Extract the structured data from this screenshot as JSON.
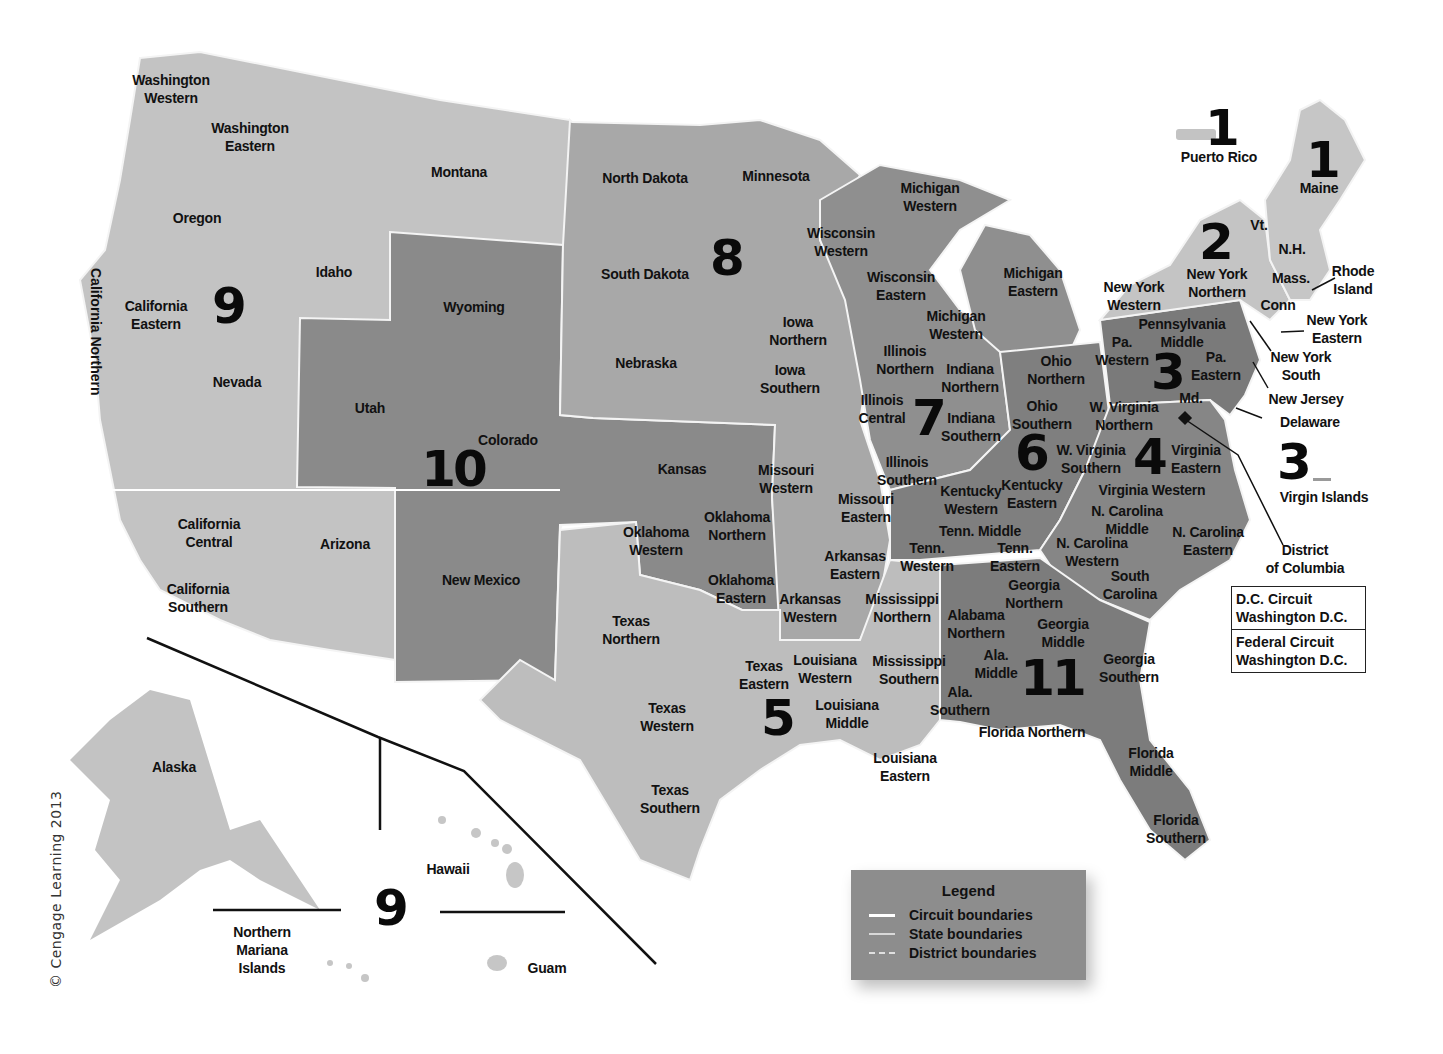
{
  "colors": {
    "background": "#ffffff",
    "circuit_light": "#c3c3c3",
    "circuit_mid": "#a8a8a8",
    "circuit_dark": "#8a8a8a",
    "circuit_darker": "#7a7a7a",
    "boundary": "#f4f4f4",
    "text": "#111111"
  },
  "circuits": [
    {
      "id": "1",
      "label": "1",
      "x": 1221,
      "y": 128
    },
    {
      "id": "1b",
      "label": "1",
      "x": 1322,
      "y": 160
    },
    {
      "id": "2",
      "label": "2",
      "x": 1215,
      "y": 242
    },
    {
      "id": "3",
      "label": "3",
      "x": 1167,
      "y": 372
    },
    {
      "id": "3b",
      "label": "3",
      "x": 1293,
      "y": 462
    },
    {
      "id": "4",
      "label": "4",
      "x": 1149,
      "y": 457
    },
    {
      "id": "5",
      "label": "5",
      "x": 777,
      "y": 718
    },
    {
      "id": "6",
      "label": "6",
      "x": 1031,
      "y": 453
    },
    {
      "id": "7",
      "label": "7",
      "x": 928,
      "y": 418
    },
    {
      "id": "8",
      "label": "8",
      "x": 726,
      "y": 258
    },
    {
      "id": "9",
      "label": "9",
      "x": 228,
      "y": 306
    },
    {
      "id": "9b",
      "label": "9",
      "x": 390,
      "y": 908
    },
    {
      "id": "10",
      "label": "10",
      "x": 453,
      "y": 469
    },
    {
      "id": "11",
      "label": "11",
      "x": 1052,
      "y": 678
    }
  ],
  "districts": [
    {
      "label": "Washington\nWestern",
      "x": 171,
      "y": 89
    },
    {
      "label": "Washington\nEastern",
      "x": 250,
      "y": 137
    },
    {
      "label": "Montana",
      "x": 459,
      "y": 172
    },
    {
      "label": "Oregon",
      "x": 197,
      "y": 218
    },
    {
      "label": "Idaho",
      "x": 334,
      "y": 272
    },
    {
      "label": "California\nEastern",
      "x": 156,
      "y": 315
    },
    {
      "label": "Nevada",
      "x": 237,
      "y": 382
    },
    {
      "label": "California\nCentral",
      "x": 209,
      "y": 533
    },
    {
      "label": "California\nSouthern",
      "x": 198,
      "y": 598
    },
    {
      "label": "Arizona",
      "x": 345,
      "y": 544
    },
    {
      "label": "Utah",
      "x": 370,
      "y": 408
    },
    {
      "label": "Wyoming",
      "x": 474,
      "y": 307
    },
    {
      "label": "Colorado",
      "x": 508,
      "y": 440
    },
    {
      "label": "New Mexico",
      "x": 481,
      "y": 580
    },
    {
      "label": "Kansas",
      "x": 682,
      "y": 469
    },
    {
      "label": "Oklahoma\nWestern",
      "x": 656,
      "y": 541
    },
    {
      "label": "Oklahoma\nNorthern",
      "x": 737,
      "y": 526
    },
    {
      "label": "Oklahoma\nEastern",
      "x": 741,
      "y": 589
    },
    {
      "label": "North Dakota",
      "x": 645,
      "y": 178
    },
    {
      "label": "South Dakota",
      "x": 645,
      "y": 274
    },
    {
      "label": "Nebraska",
      "x": 646,
      "y": 363
    },
    {
      "label": "Minnesota",
      "x": 776,
      "y": 176
    },
    {
      "label": "Iowa\nNorthern",
      "x": 798,
      "y": 331
    },
    {
      "label": "Iowa\nSouthern",
      "x": 790,
      "y": 379
    },
    {
      "label": "Missouri\nWestern",
      "x": 786,
      "y": 479
    },
    {
      "label": "Missouri\nEastern",
      "x": 866,
      "y": 508
    },
    {
      "label": "Arkansas\nEastern",
      "x": 855,
      "y": 565
    },
    {
      "label": "Arkansas\nWestern",
      "x": 810,
      "y": 608
    },
    {
      "label": "Texas\nNorthern",
      "x": 631,
      "y": 630
    },
    {
      "label": "Texas\nEastern",
      "x": 764,
      "y": 675
    },
    {
      "label": "Texas\nWestern",
      "x": 667,
      "y": 717
    },
    {
      "label": "Texas\nSouthern",
      "x": 670,
      "y": 799
    },
    {
      "label": "Louisiana\nWestern",
      "x": 825,
      "y": 669
    },
    {
      "label": "Louisiana\nMiddle",
      "x": 847,
      "y": 714
    },
    {
      "label": "Louisiana\nEastern",
      "x": 905,
      "y": 767
    },
    {
      "label": "Mississippi\nNorthern",
      "x": 902,
      "y": 608
    },
    {
      "label": "Mississippi\nSouthern",
      "x": 909,
      "y": 670
    },
    {
      "label": "Wisconsin\nWestern",
      "x": 841,
      "y": 242
    },
    {
      "label": "Wisconsin\nEastern",
      "x": 901,
      "y": 286
    },
    {
      "label": "Michigan\nWestern",
      "x": 930,
      "y": 197
    },
    {
      "label": "Michigan\nWestern",
      "x": 956,
      "y": 325
    },
    {
      "label": "Michigan\nEastern",
      "x": 1033,
      "y": 282
    },
    {
      "label": "Illinois\nNorthern",
      "x": 905,
      "y": 360
    },
    {
      "label": "Illinois\nCentral",
      "x": 882,
      "y": 409
    },
    {
      "label": "Illinois\nSouthern",
      "x": 907,
      "y": 471
    },
    {
      "label": "Indiana\nNorthern",
      "x": 970,
      "y": 378
    },
    {
      "label": "Indiana\nSouthern",
      "x": 971,
      "y": 427
    },
    {
      "label": "Ohio\nNorthern",
      "x": 1056,
      "y": 370
    },
    {
      "label": "Ohio\nSouthern",
      "x": 1042,
      "y": 415
    },
    {
      "label": "Kentucky\nWestern",
      "x": 971,
      "y": 500
    },
    {
      "label": "Kentucky\nEastern",
      "x": 1032,
      "y": 494
    },
    {
      "label": "Tenn. Middle",
      "x": 980,
      "y": 531
    },
    {
      "label": "Tenn.\nWestern",
      "x": 927,
      "y": 557
    },
    {
      "label": "Tenn.\nEastern",
      "x": 1015,
      "y": 557
    },
    {
      "label": "Alabama\nNorthern",
      "x": 976,
      "y": 624
    },
    {
      "label": "Ala.\nMiddle",
      "x": 996,
      "y": 664
    },
    {
      "label": "Ala.\nSouthern",
      "x": 960,
      "y": 701
    },
    {
      "label": "Georgia\nNorthern",
      "x": 1034,
      "y": 594
    },
    {
      "label": "Georgia\nMiddle",
      "x": 1063,
      "y": 633
    },
    {
      "label": "Georgia\nSouthern",
      "x": 1129,
      "y": 668
    },
    {
      "label": "Florida Northern",
      "x": 1032,
      "y": 732
    },
    {
      "label": "Florida\nMiddle",
      "x": 1151,
      "y": 762
    },
    {
      "label": "Florida\nSouthern",
      "x": 1176,
      "y": 829
    },
    {
      "label": "South\nCarolina",
      "x": 1130,
      "y": 585
    },
    {
      "label": "N. Carolina\nWestern",
      "x": 1092,
      "y": 552
    },
    {
      "label": "N. Carolina\nMiddle",
      "x": 1127,
      "y": 520
    },
    {
      "label": "N. Carolina\nEastern",
      "x": 1208,
      "y": 541
    },
    {
      "label": "Virginia Western",
      "x": 1152,
      "y": 490
    },
    {
      "label": "Virginia\nEastern",
      "x": 1196,
      "y": 459
    },
    {
      "label": "W. Virginia\nNorthern",
      "x": 1124,
      "y": 416
    },
    {
      "label": "W. Virginia\nSouthern",
      "x": 1091,
      "y": 459
    },
    {
      "label": "Pa.\nWestern",
      "x": 1122,
      "y": 351
    },
    {
      "label": "Pennsylvania\nMiddle",
      "x": 1182,
      "y": 333
    },
    {
      "label": "Pa.\nEastern",
      "x": 1216,
      "y": 366
    },
    {
      "label": "Md.",
      "x": 1191,
      "y": 398
    },
    {
      "label": "New York\nWestern",
      "x": 1134,
      "y": 296
    },
    {
      "label": "New York\nNorthern",
      "x": 1217,
      "y": 283
    },
    {
      "label": "Vt.",
      "x": 1259,
      "y": 225
    },
    {
      "label": "N.H.",
      "x": 1292,
      "y": 249
    },
    {
      "label": "Mass.",
      "x": 1291,
      "y": 278
    },
    {
      "label": "Conn",
      "x": 1278,
      "y": 305
    },
    {
      "label": "Rhode\nIsland",
      "x": 1353,
      "y": 280
    },
    {
      "label": "New York\nEastern",
      "x": 1337,
      "y": 329
    },
    {
      "label": "New York\nSouth",
      "x": 1301,
      "y": 366
    },
    {
      "label": "New Jersey",
      "x": 1306,
      "y": 399
    },
    {
      "label": "Delaware",
      "x": 1310,
      "y": 422
    },
    {
      "label": "Maine",
      "x": 1319,
      "y": 188
    },
    {
      "label": "Puerto Rico",
      "x": 1219,
      "y": 157
    },
    {
      "label": "Virgin Islands",
      "x": 1324,
      "y": 497
    },
    {
      "label": "District\nof Columbia",
      "x": 1305,
      "y": 559
    },
    {
      "label": "Alaska",
      "x": 174,
      "y": 767
    },
    {
      "label": "Hawaii",
      "x": 448,
      "y": 869
    },
    {
      "label": "Northern\nMariana\nIslands",
      "x": 262,
      "y": 950
    },
    {
      "label": "Guam",
      "x": 547,
      "y": 968
    }
  ],
  "vertical_label": {
    "text": "California Northern",
    "x": 104,
    "y": 268
  },
  "dc_box": {
    "cells": [
      "D.C. Circuit\nWashington D.C.",
      "Federal Circuit\nWashington D.C."
    ]
  },
  "legend": {
    "title": "Legend",
    "items": [
      {
        "label": "Circuit boundaries",
        "style": "solid-bold"
      },
      {
        "label": "State boundaries",
        "style": "solid-thin"
      },
      {
        "label": "District boundaries",
        "style": "dashed"
      }
    ]
  },
  "copyright": "© Cengage Learning 2013"
}
